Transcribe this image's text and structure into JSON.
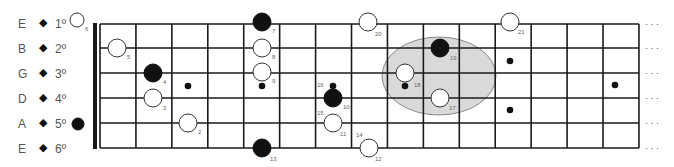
{
  "diagram": {
    "title": "",
    "type": "guitar-fretboard-scale-map",
    "strings": [
      {
        "name": "E",
        "number": "1º"
      },
      {
        "name": "B",
        "number": "2º"
      },
      {
        "name": "G",
        "number": "3º"
      },
      {
        "name": "D",
        "number": "4º"
      },
      {
        "name": "A",
        "number": "5º"
      },
      {
        "name": "E",
        "number": "6º"
      }
    ],
    "string_bullet": "◆",
    "fret_count": 15,
    "continuation": "· · ·",
    "colors": {
      "line": "#1a1a1a",
      "filled_note": "#111111",
      "open_note_fill": "#ffffff",
      "highlight_region": "#d9d9d9",
      "highlight_border": "#888888",
      "label_text": "#666666"
    },
    "notes": [
      {
        "id": 1,
        "type": "open",
        "cx": 77,
        "cy": 20,
        "r": 7,
        "label": "6",
        "lx": 85,
        "ly": 31
      },
      {
        "id": 2,
        "type": "filled",
        "cx": 78,
        "cy": 124,
        "r": 6,
        "label": "",
        "lx": 0,
        "ly": 0
      },
      {
        "id": 3,
        "type": "open",
        "cx": 117,
        "cy": 48,
        "r": 9,
        "label": "5",
        "lx": 127,
        "ly": 59
      },
      {
        "id": 4,
        "type": "filled",
        "cx": 153,
        "cy": 73,
        "r": 9,
        "label": "4",
        "lx": 163,
        "ly": 84
      },
      {
        "id": 5,
        "type": "open",
        "cx": 153,
        "cy": 98,
        "r": 9,
        "label": "3",
        "lx": 163,
        "ly": 110
      },
      {
        "id": 6,
        "type": "open",
        "cx": 188,
        "cy": 123,
        "r": 9,
        "label": "2",
        "lx": 198,
        "ly": 134
      },
      {
        "id": 7,
        "type": "filled",
        "cx": 262,
        "cy": 22,
        "r": 9,
        "label": "7",
        "lx": 272,
        "ly": 33
      },
      {
        "id": 8,
        "type": "open",
        "cx": 262,
        "cy": 48,
        "r": 9,
        "label": "8",
        "lx": 272,
        "ly": 59
      },
      {
        "id": 9,
        "type": "open",
        "cx": 262,
        "cy": 72,
        "r": 9,
        "label": "9",
        "lx": 272,
        "ly": 83
      },
      {
        "id": 10,
        "type": "filled",
        "cx": 333,
        "cy": 98,
        "r": 9,
        "label": "10",
        "lx": 343,
        "ly": 109
      },
      {
        "id": 11,
        "type": "open",
        "cx": 333,
        "cy": 123,
        "r": 9,
        "label": "11",
        "lx": 340,
        "ly": 136
      },
      {
        "id": 12,
        "type": "open",
        "cx": 369,
        "cy": 148,
        "r": 9,
        "label": "12",
        "lx": 375,
        "ly": 161
      },
      {
        "id": 13,
        "type": "filled",
        "cx": 262,
        "cy": 148,
        "r": 9,
        "label": "13",
        "lx": 270,
        "ly": 161
      },
      {
        "id": 17,
        "type": "open",
        "cx": 440,
        "cy": 98,
        "r": 9,
        "label": "17",
        "lx": 449,
        "ly": 110
      },
      {
        "id": 18,
        "type": "open",
        "cx": 405,
        "cy": 73,
        "r": 9,
        "label": "18",
        "lx": 414,
        "ly": 87
      },
      {
        "id": 19,
        "type": "filled",
        "cx": 440,
        "cy": 48,
        "r": 9,
        "label": "19",
        "lx": 450,
        "ly": 60
      },
      {
        "id": 20,
        "type": "open",
        "cx": 368,
        "cy": 22,
        "r": 9,
        "label": "20",
        "lx": 375,
        "ly": 36
      },
      {
        "id": 21,
        "type": "open",
        "cx": 510,
        "cy": 22,
        "r": 9,
        "label": "21",
        "lx": 518,
        "ly": 34
      }
    ],
    "small_dots": [
      {
        "cx": 188,
        "cy": 86,
        "label": ""
      },
      {
        "cx": 262,
        "cy": 86,
        "label": ""
      },
      {
        "cx": 333,
        "cy": 86,
        "label": "16",
        "lx": 317,
        "ly": 87
      },
      {
        "cx": 405,
        "cy": 86,
        "label": ""
      },
      {
        "cx": 510,
        "cy": 61,
        "label": ""
      },
      {
        "cx": 510,
        "cy": 110,
        "label": ""
      },
      {
        "cx": 615,
        "cy": 85,
        "label": ""
      }
    ],
    "free_labels": [
      {
        "text": "15",
        "x": 317,
        "y": 115
      },
      {
        "text": "14",
        "x": 356,
        "y": 137
      }
    ],
    "highlight_ellipse": {
      "cx": 439,
      "cy": 76,
      "rx": 57,
      "ry": 39
    }
  }
}
